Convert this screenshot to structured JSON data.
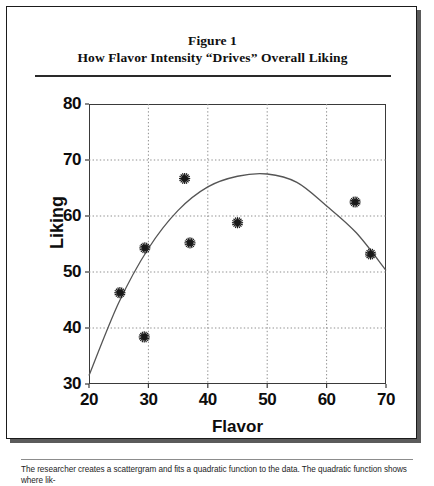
{
  "figure": {
    "title_line1": "Figure 1",
    "title_line2": "How Flavor Intensity “Drives” Overall Liking",
    "caption": "The researcher creates a scattergram and fits a quadratic function to the data. The quadratic function shows where lik-"
  },
  "chart_data": {
    "type": "scatter",
    "title": "How Flavor Intensity “Drives” Overall Liking",
    "subtitle": "Figure 1",
    "xlabel": "Flavor",
    "ylabel": "Liking",
    "xlim": [
      20,
      70
    ],
    "ylim": [
      30,
      80
    ],
    "xticks": [
      20,
      30,
      40,
      50,
      60,
      70
    ],
    "yticks": [
      30,
      40,
      50,
      60,
      70,
      80
    ],
    "xtick_labels": [
      "20",
      "30",
      "40",
      "50",
      "60",
      "70"
    ],
    "ytick_labels": [
      "30",
      "40",
      "50",
      "60",
      "70",
      "80"
    ],
    "grid": "dotted-both",
    "legend": "none",
    "marker": "starburst",
    "points": [
      {
        "x": 25.2,
        "y": 46.3
      },
      {
        "x": 29.3,
        "y": 38.4
      },
      {
        "x": 29.4,
        "y": 54.3
      },
      {
        "x": 36.1,
        "y": 66.7
      },
      {
        "x": 37.0,
        "y": 55.2
      },
      {
        "x": 45.0,
        "y": 58.8
      },
      {
        "x": 64.8,
        "y": 62.5
      },
      {
        "x": 67.4,
        "y": 53.2
      }
    ],
    "fit": {
      "kind": "quadratic",
      "description": "quadratic function fitted to the data",
      "vertex": {
        "x": 50.0,
        "y": 67.5
      },
      "endpoints": [
        {
          "x": 20.0,
          "y": 31.5
        },
        {
          "x": 70.0,
          "y": 50.3
        }
      ],
      "samples": [
        {
          "x": 20.0,
          "y": 31.5
        },
        {
          "x": 25.0,
          "y": 44.5
        },
        {
          "x": 30.0,
          "y": 54.2
        },
        {
          "x": 35.0,
          "y": 61.0
        },
        {
          "x": 40.0,
          "y": 65.2
        },
        {
          "x": 45.0,
          "y": 67.1
        },
        {
          "x": 50.0,
          "y": 67.5
        },
        {
          "x": 55.0,
          "y": 66.0
        },
        {
          "x": 60.0,
          "y": 61.8
        },
        {
          "x": 65.0,
          "y": 57.0
        },
        {
          "x": 70.0,
          "y": 50.3
        }
      ]
    },
    "colors": {
      "axis": "#3a3a3a",
      "grid": "#8f8f8f",
      "marker": "#1a1a1a",
      "curve": "#555555",
      "text": "#0d0d0d"
    }
  }
}
